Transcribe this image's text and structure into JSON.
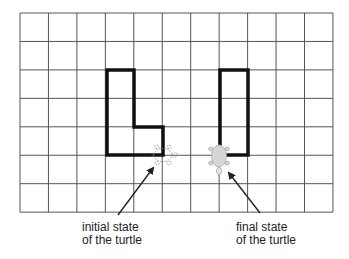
{
  "diagram": {
    "grid": {
      "left": 20,
      "top": 13,
      "cols": 11,
      "rows": 7,
      "cell_w": 28.45,
      "cell_h": 28.45,
      "line_color": "#555555"
    },
    "shapes": {
      "stroke_color": "#111111",
      "l_shape_points": "107,70 134,70 134,127 163,127 163,155 107,155",
      "rect_points": "220,70 248,70 248,155 220,155"
    },
    "turtles": {
      "initial": {
        "x": 163,
        "y": 155,
        "heading": "east",
        "style": "dashed-outline"
      },
      "final": {
        "x": 219,
        "y": 155,
        "heading": "south",
        "style": "filled",
        "fill": "#d6d6d6"
      }
    },
    "labels": {
      "initial_line1": "initial state",
      "initial_line2": "of the turtle",
      "final_line1": "final state",
      "final_line2": "of the turtle"
    },
    "arrows": {
      "initial": {
        "from": [
          118,
          215
        ],
        "to": [
          153,
          168
        ]
      },
      "final": {
        "from": [
          260,
          213
        ],
        "to": [
          229,
          173
        ]
      }
    }
  }
}
